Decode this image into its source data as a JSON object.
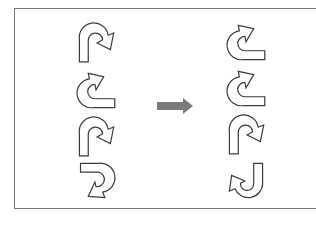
{
  "diagram": {
    "left_column": [
      {
        "shape": "u-turn-arrow",
        "orientation": "opening-down-head-right-down",
        "rotation": 0,
        "flip": false
      },
      {
        "shape": "u-turn-arrow",
        "orientation": "opening-right-head-up-right",
        "rotation": 270,
        "flip": false
      },
      {
        "shape": "u-turn-arrow",
        "orientation": "opening-down-head-right-down",
        "rotation": 0,
        "flip": false
      },
      {
        "shape": "u-turn-arrow",
        "orientation": "opening-left-head-down-left",
        "rotation": 90,
        "flip": false
      }
    ],
    "right_column": [
      {
        "shape": "u-turn-arrow",
        "orientation": "opening-right-head-up-right",
        "rotation": 270,
        "flip": false
      },
      {
        "shape": "u-turn-arrow",
        "orientation": "opening-right-head-up-right",
        "rotation": 270,
        "flip": false
      },
      {
        "shape": "u-turn-arrow",
        "orientation": "opening-down-head-right-down",
        "rotation": 0,
        "flip": false
      },
      {
        "shape": "u-turn-arrow",
        "orientation": "opening-up-head-left-up",
        "rotation": 180,
        "flip": false
      }
    ],
    "transform_arrow": {
      "icon": "right-arrow-icon",
      "color": "#7b7b7b"
    },
    "colors": {
      "outline": "#3c3c3c",
      "frame": "#7a7a7a",
      "background": "#ffffff"
    }
  }
}
